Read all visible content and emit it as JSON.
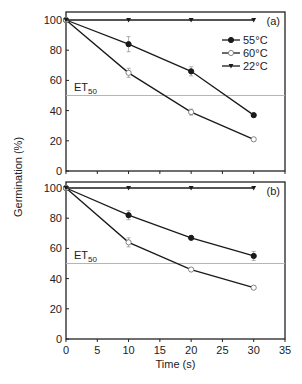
{
  "chart_data": [
    {
      "panel": "(a)",
      "type": "line",
      "xlabel": "Time (s)",
      "ylabel": "Germination (%)",
      "x": [
        0,
        10,
        20,
        30
      ],
      "xlim": [
        0,
        35
      ],
      "ylim": [
        0,
        100
      ],
      "xticks": [
        0,
        5,
        10,
        15,
        20,
        25,
        30,
        35
      ],
      "yticks": [
        0,
        20,
        40,
        60,
        80,
        100
      ],
      "grid": false,
      "legend_position": "upper right",
      "reference_line": {
        "label": "ET",
        "subscript": "50",
        "y": 50
      },
      "series": [
        {
          "name": "55°C",
          "marker": "filled-circle",
          "values": [
            100,
            84,
            66,
            37
          ],
          "errors": [
            0,
            5,
            3,
            1
          ]
        },
        {
          "name": "60°C",
          "marker": "open-circle",
          "values": [
            100,
            65,
            39,
            21
          ],
          "errors": [
            0,
            3,
            2,
            1
          ]
        },
        {
          "name": "22°C",
          "marker": "filled-triangle-down",
          "values": [
            100,
            100,
            100,
            100
          ],
          "errors": [
            0,
            0,
            0,
            0
          ]
        }
      ]
    },
    {
      "panel": "(b)",
      "type": "line",
      "xlabel": "Time (s)",
      "ylabel": "Germination (%)",
      "x": [
        0,
        10,
        20,
        30
      ],
      "xlim": [
        0,
        35
      ],
      "ylim": [
        0,
        100
      ],
      "xticks": [
        0,
        5,
        10,
        15,
        20,
        25,
        30,
        35
      ],
      "yticks": [
        0,
        20,
        40,
        60,
        80,
        100
      ],
      "grid": false,
      "reference_line": {
        "label": "ET",
        "subscript": "50",
        "y": 50
      },
      "series": [
        {
          "name": "55°C",
          "marker": "filled-circle",
          "values": [
            100,
            82,
            67,
            55
          ],
          "errors": [
            0,
            3,
            1,
            3
          ]
        },
        {
          "name": "60°C",
          "marker": "open-circle",
          "values": [
            100,
            64,
            46,
            34
          ],
          "errors": [
            0,
            3,
            1,
            1
          ]
        },
        {
          "name": "22°C",
          "marker": "filled-triangle-down",
          "values": [
            100,
            100,
            100,
            100
          ],
          "errors": [
            0,
            0,
            0,
            0
          ]
        }
      ]
    }
  ],
  "labels": {
    "ylabel": "Germination (%)",
    "xlabel": "Time (s)",
    "panel_a": "(a)",
    "panel_b": "(b)",
    "et_main": "ET",
    "et_sub": "50"
  },
  "legend": [
    {
      "name": "55°C",
      "marker": "filled-circle"
    },
    {
      "name": "60°C",
      "marker": "open-circle"
    },
    {
      "name": "22°C",
      "marker": "filled-triangle-down"
    }
  ],
  "colors": {
    "line": "#1a1a1a",
    "axis": "#222222",
    "reference": "#b5b5b5",
    "errorbar": "#9a9a9a"
  }
}
